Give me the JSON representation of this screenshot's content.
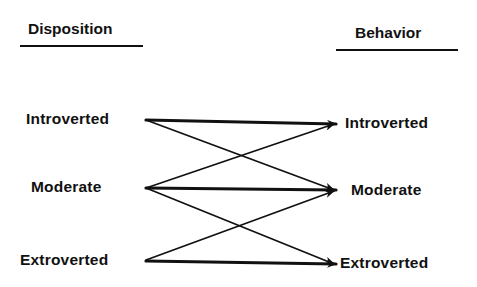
{
  "headers": {
    "left": "Disposition",
    "right": "Behavior"
  },
  "left_nodes": [
    {
      "id": "disp-introverted",
      "label": "Introverted"
    },
    {
      "id": "disp-moderate",
      "label": "Moderate"
    },
    {
      "id": "disp-extroverted",
      "label": "Extroverted"
    }
  ],
  "right_nodes": [
    {
      "id": "beh-introverted",
      "label": "Introverted"
    },
    {
      "id": "beh-moderate",
      "label": "Moderate"
    },
    {
      "id": "beh-extroverted",
      "label": "Extroverted"
    }
  ],
  "edges": [
    {
      "from": "disp-introverted",
      "to": "beh-introverted",
      "weight": "thick"
    },
    {
      "from": "disp-introverted",
      "to": "beh-moderate",
      "weight": "thin"
    },
    {
      "from": "disp-moderate",
      "to": "beh-introverted",
      "weight": "thin"
    },
    {
      "from": "disp-moderate",
      "to": "beh-moderate",
      "weight": "thick"
    },
    {
      "from": "disp-moderate",
      "to": "beh-extroverted",
      "weight": "thin"
    },
    {
      "from": "disp-extroverted",
      "to": "beh-moderate",
      "weight": "thin"
    },
    {
      "from": "disp-extroverted",
      "to": "beh-extroverted",
      "weight": "thick"
    }
  ],
  "colors": {
    "ink": "#111111",
    "background": "#ffffff"
  }
}
